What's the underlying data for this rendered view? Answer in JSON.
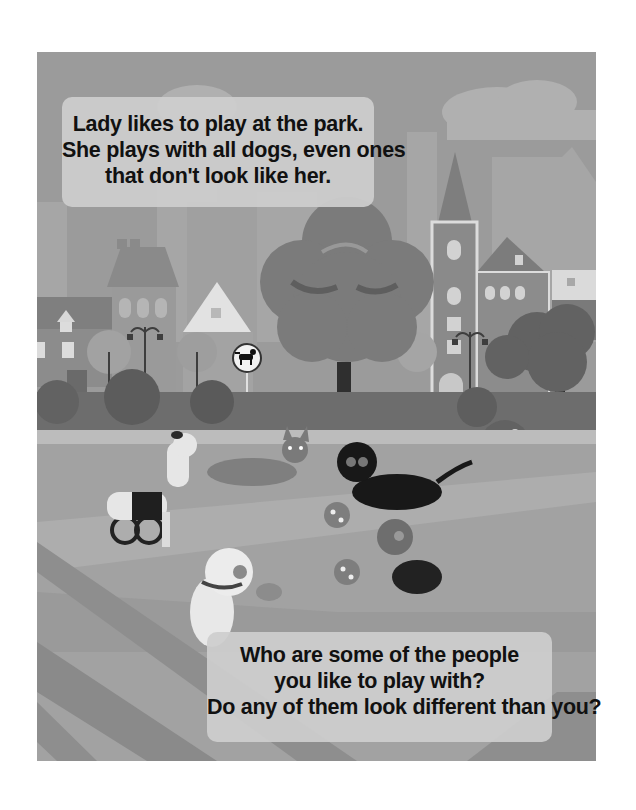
{
  "page": {
    "background": "#ffffff",
    "illustration_style": "grayscale"
  },
  "top_caption": {
    "lines": [
      "Lady likes to play at the park.",
      "She plays with all dogs, even ones",
      "that don't look like her."
    ]
  },
  "bottom_caption": {
    "lines": [
      "Who are some of the people",
      "you like to play with?",
      "Do any of them look different than you?"
    ]
  },
  "scene": {
    "setting": "city park",
    "elements": [
      "sky-with-clouds",
      "city-skyline",
      "townhouses",
      "church-tower",
      "street-lamps",
      "dog-park-sign",
      "large-tree",
      "bushes",
      "flower-bush",
      "striped-lawn"
    ],
    "sign_icon": "dog-icon",
    "characters": [
      "dog-in-wheelchair",
      "leaping-bulldog",
      "black-dog",
      "white-dog-with-frisbee",
      "small-pug-in-sweater"
    ],
    "props": [
      "ball",
      "ball",
      "frisbee"
    ]
  },
  "colors": {
    "sky": "#9b9b9b",
    "cloud": "#b4b4b4",
    "skyline_far": "#a9a9a9",
    "building": "#8d8d8d",
    "building_light": "#c4c4c4",
    "tree_canopy": "#7a7a7a",
    "tree_dark": "#5e5e5e",
    "bush": "#666666",
    "lawn_light": "#a8a8a8",
    "lawn_mid": "#979797",
    "lawn_dark": "#868686",
    "path": "#bdbdbd",
    "caption_box": "#cdcdcd",
    "caption_text": "#111111"
  }
}
